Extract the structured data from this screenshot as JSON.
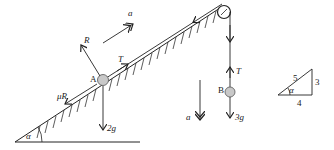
{
  "diagram": {
    "particle_a": {
      "label": "A",
      "weight_label": "2g",
      "normal_label": "R",
      "friction_label": "μR",
      "tension_label": "T"
    },
    "particle_b": {
      "label": "B",
      "weight_label": "3g",
      "tension_label": "T"
    },
    "acceleration_label": "a",
    "acceleration_b_label": "a",
    "angle_label": "α",
    "triangle": {
      "hypotenuse": "5",
      "opposite": "3",
      "adjacent": "4",
      "angle": "α"
    },
    "colors": {
      "line": "#222222",
      "ball": "#c8c8c8",
      "ball_stroke": "#555555"
    }
  }
}
